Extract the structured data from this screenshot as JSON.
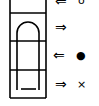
{
  "diagram": {
    "rows": [
      {
        "arrow": "⇐",
        "symbol": "o",
        "direction": "left"
      },
      {
        "arrow": "⇒",
        "symbol": "",
        "direction": "right"
      },
      {
        "arrow": "⇐",
        "symbol": "●",
        "direction": "left"
      },
      {
        "arrow": "⇒",
        "symbol": "×",
        "direction": "right"
      }
    ],
    "colors": {
      "stroke": "#000000",
      "background": "#ffffff"
    }
  }
}
